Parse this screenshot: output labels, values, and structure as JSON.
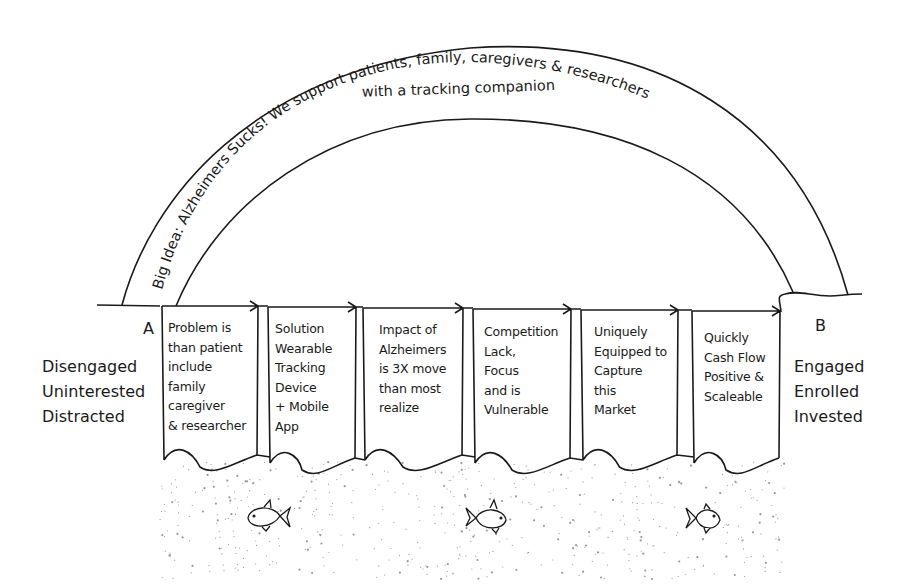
{
  "arc": {
    "line1": "Big Idea: Alzheimers Sucks! We support patients, family, caregivers & researchers",
    "line2": "with a tracking companion"
  },
  "start": {
    "letter": "A",
    "states": [
      "Disengaged",
      "Uninterested",
      "Distracted"
    ]
  },
  "end": {
    "letter": "B",
    "states": [
      "Engaged",
      "Enrolled",
      "Invested"
    ]
  },
  "steps": [
    {
      "label": "Problem is\nthan patient\ninclude\nfamily\ncaregiver\n& researcher"
    },
    {
      "label": "Solution\nWearable\nTracking\nDevice\n+ Mobile\nApp"
    },
    {
      "label": "Impact of\nAlzheimers\nis 3X move\nthan most\nrealize"
    },
    {
      "label": "Competition\nLack,\nFocus\nand is\nVulnerable"
    },
    {
      "label": "Uniquely\nEquipped to\nCapture\nthis\nMarket"
    },
    {
      "label": "Quickly\nCash Flow\nPositive &\nScaleable"
    }
  ],
  "icons": [
    "fish-icon",
    "fish-icon",
    "fish-icon"
  ],
  "colors": {
    "ink": "#1a1a1a",
    "background": "#ffffff",
    "dots": "#9a9a9a"
  }
}
